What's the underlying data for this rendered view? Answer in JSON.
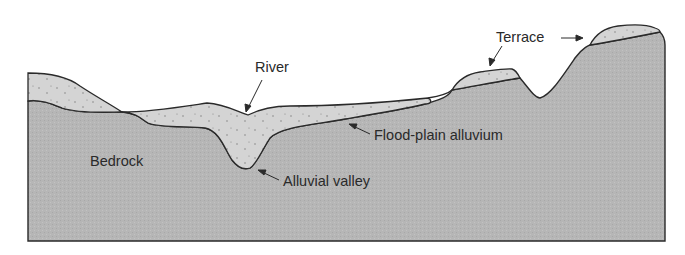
{
  "figure": {
    "type": "geologic-cross-section",
    "colors": {
      "bedrock": "#b4b4b4",
      "alluvium": "#d4d4d4",
      "outline": "#2a2a2a",
      "background": "#ffffff",
      "text": "#2a2a2a"
    }
  },
  "labels": {
    "river": "River",
    "terrace": "Terrace",
    "bedrock": "Bedrock",
    "flood_plain_alluvium": "Flood-plain alluvium",
    "alluvial_valley": "Alluvial valley"
  }
}
